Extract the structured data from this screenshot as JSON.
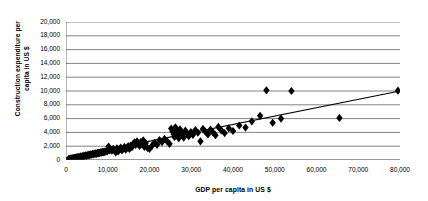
{
  "chart_data": {
    "type": "scatter",
    "title": "",
    "xlabel": "GDP per capita in US $",
    "ylabel": "Construction expenditure per capita in US $",
    "ylabel_line1": "Construction expenditure per",
    "ylabel_line2": "capita in US $",
    "xlim": [
      0,
      80000
    ],
    "ylim": [
      0,
      20000
    ],
    "xticks": [
      0,
      10000,
      20000,
      30000,
      40000,
      50000,
      60000,
      70000,
      80000
    ],
    "yticks": [
      0,
      2000,
      4000,
      6000,
      8000,
      10000,
      12000,
      14000,
      16000,
      18000,
      20000
    ],
    "xtick_labels": [
      "0",
      "10,000",
      "20,000",
      "30,000",
      "40,000",
      "50,000",
      "60,000",
      "70,000",
      "80,000"
    ],
    "ytick_labels": [
      "0",
      "2,000",
      "4,000",
      "6,000",
      "8,000",
      "10,000",
      "12,000",
      "14,000",
      "16,000",
      "18,000",
      "20,000"
    ],
    "grid": {
      "horizontal": true,
      "vertical": false
    },
    "legend": {
      "visible": false
    },
    "marker": {
      "shape": "diamond",
      "color": "#000000",
      "size": 5
    },
    "trendline": {
      "visible": true,
      "color": "#000000",
      "points": [
        [
          0,
          300
        ],
        [
          80000,
          10000
        ]
      ]
    },
    "series": [
      {
        "name": "Countries",
        "points": [
          [
            600,
            120
          ],
          [
            800,
            150
          ],
          [
            900,
            100
          ],
          [
            1100,
            200
          ],
          [
            1250,
            180
          ],
          [
            1400,
            250
          ],
          [
            1500,
            160
          ],
          [
            1700,
            300
          ],
          [
            1850,
            220
          ],
          [
            2000,
            280
          ],
          [
            2150,
            330
          ],
          [
            2300,
            260
          ],
          [
            2450,
            380
          ],
          [
            2600,
            300
          ],
          [
            2800,
            420
          ],
          [
            2950,
            350
          ],
          [
            3100,
            460
          ],
          [
            3300,
            400
          ],
          [
            3500,
            520
          ],
          [
            3700,
            450
          ],
          [
            3900,
            560
          ],
          [
            4100,
            500
          ],
          [
            4300,
            620
          ],
          [
            4500,
            560
          ],
          [
            4700,
            680
          ],
          [
            4900,
            600
          ],
          [
            5100,
            720
          ],
          [
            5300,
            660
          ],
          [
            5500,
            780
          ],
          [
            5700,
            700
          ],
          [
            5900,
            820
          ],
          [
            6100,
            760
          ],
          [
            6300,
            880
          ],
          [
            6500,
            800
          ],
          [
            6700,
            920
          ],
          [
            6900,
            860
          ],
          [
            7100,
            980
          ],
          [
            7300,
            900
          ],
          [
            7500,
            1020
          ],
          [
            7700,
            960
          ],
          [
            7900,
            1080
          ],
          [
            8100,
            1000
          ],
          [
            8300,
            1120
          ],
          [
            8500,
            1060
          ],
          [
            8700,
            1180
          ],
          [
            8900,
            1100
          ],
          [
            9100,
            1220
          ],
          [
            9300,
            1150
          ],
          [
            9600,
            1300
          ],
          [
            9900,
            1250
          ],
          [
            10200,
            1950
          ],
          [
            10400,
            1400
          ],
          [
            10700,
            1500
          ],
          [
            11000,
            1350
          ],
          [
            11300,
            1600
          ],
          [
            11600,
            1450
          ],
          [
            11900,
            1100
          ],
          [
            12200,
            1700
          ],
          [
            12500,
            1250
          ],
          [
            12800,
            1550
          ],
          [
            13100,
            1800
          ],
          [
            13400,
            1400
          ],
          [
            13700,
            1650
          ],
          [
            14000,
            1900
          ],
          [
            14300,
            1500
          ],
          [
            14600,
            1750
          ],
          [
            14900,
            2000
          ],
          [
            15200,
            1600
          ],
          [
            15500,
            2100
          ],
          [
            15800,
            1850
          ],
          [
            16100,
            2350
          ],
          [
            16400,
            2550
          ],
          [
            16700,
            2200
          ],
          [
            17000,
            2700
          ],
          [
            17300,
            2400
          ],
          [
            17600,
            2050
          ],
          [
            17900,
            2600
          ],
          [
            18200,
            2250
          ],
          [
            18500,
            2850
          ],
          [
            18800,
            1900
          ],
          [
            19100,
            2450
          ],
          [
            19500,
            1750
          ],
          [
            20000,
            1600
          ],
          [
            20600,
            2050
          ],
          [
            21200,
            2500
          ],
          [
            21800,
            2200
          ],
          [
            22400,
            2900
          ],
          [
            23000,
            2600
          ],
          [
            23600,
            3050
          ],
          [
            24200,
            2750
          ],
          [
            24800,
            2350
          ],
          [
            25200,
            4550
          ],
          [
            25500,
            4150
          ],
          [
            25800,
            3750
          ],
          [
            26000,
            3350
          ],
          [
            26200,
            4750
          ],
          [
            26400,
            4350
          ],
          [
            26600,
            3950
          ],
          [
            26800,
            3550
          ],
          [
            27000,
            3150
          ],
          [
            27300,
            4450
          ],
          [
            27600,
            4050
          ],
          [
            27900,
            3650
          ],
          [
            28200,
            3250
          ],
          [
            28600,
            4250
          ],
          [
            29000,
            3850
          ],
          [
            29400,
            3450
          ],
          [
            29900,
            4050
          ],
          [
            30400,
            3650
          ],
          [
            31000,
            4350
          ],
          [
            31600,
            3950
          ],
          [
            32200,
            2700
          ],
          [
            32800,
            4500
          ],
          [
            33400,
            4100
          ],
          [
            34000,
            3700
          ],
          [
            34600,
            4400
          ],
          [
            35200,
            4000
          ],
          [
            35800,
            3600
          ],
          [
            36500,
            4800
          ],
          [
            37200,
            4300
          ],
          [
            38000,
            3900
          ],
          [
            39000,
            4600
          ],
          [
            40000,
            4200
          ],
          [
            41500,
            5000
          ],
          [
            43000,
            4700
          ],
          [
            44500,
            5600
          ],
          [
            46500,
            6400
          ],
          [
            48000,
            10100
          ],
          [
            49500,
            5400
          ],
          [
            51500,
            6000
          ],
          [
            54000,
            10000
          ],
          [
            65500,
            6100
          ],
          [
            79500,
            10050
          ]
        ]
      }
    ]
  }
}
